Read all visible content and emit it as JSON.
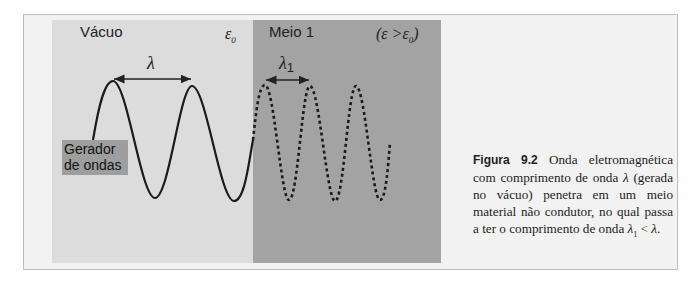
{
  "figure": {
    "panels": {
      "vacuum": {
        "label": "Vácuo",
        "permittivity_symbol": "ε",
        "permittivity_sub": "0",
        "color": "#dcdcdc"
      },
      "medium": {
        "label": "Meio 1",
        "condition_open": "(ε >ε",
        "condition_sub": "0",
        "condition_close": ")",
        "color": "#a3a3a3"
      }
    },
    "wavelength_vacuum": {
      "symbol": "λ"
    },
    "wavelength_medium": {
      "symbol": "λ",
      "sub": "1"
    },
    "generator": {
      "line1": "Gerador",
      "line2": "de ondas",
      "color": "#9e9e9e"
    }
  },
  "caption": {
    "figure_label": "Figura 9.2",
    "text_part1": " Onda eletromagnética com comprimento de onda ",
    "lambda": "λ",
    "text_part2": " (gerada no vácuo) penetra em um meio material não condutor, no qual passa a ter o comprimento de onda ",
    "lambda1": "λ",
    "lambda1_sub": "1",
    "relation": " < ",
    "lambda_end": "λ",
    "period": "."
  }
}
